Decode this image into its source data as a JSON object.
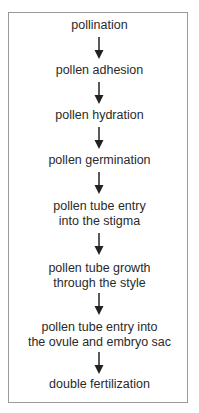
{
  "diagram": {
    "type": "flowchart",
    "direction": "top-to-bottom",
    "steps": [
      {
        "label": "pollination"
      },
      {
        "label": "pollen adhesion"
      },
      {
        "label": "pollen hydration"
      },
      {
        "label": "pollen germination"
      },
      {
        "label": "pollen tube entry\ninto the stigma"
      },
      {
        "label": "pollen tube growth\nthrough the style"
      },
      {
        "label": "pollen tube entry into\nthe ovule and embryo sac"
      },
      {
        "label": "double fertilization"
      }
    ],
    "colors": {
      "text": "#2a2a2a",
      "border": "#9a9a9a",
      "arrow": "#222222",
      "background": "#ffffff"
    }
  }
}
